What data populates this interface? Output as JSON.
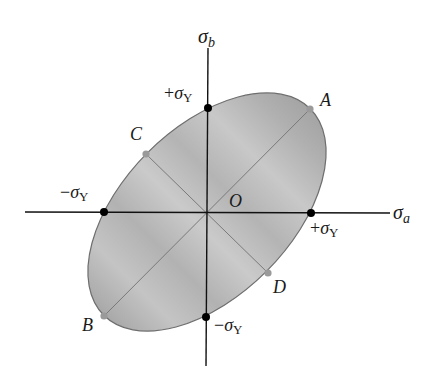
{
  "figure": {
    "type": "yield-locus-diagram",
    "axes": {
      "x_label": "σ",
      "x_sub": "a",
      "y_label": "σ",
      "y_sub": "b"
    },
    "origin_label": "O",
    "axis_intercepts": {
      "pos_x": {
        "sign": "+",
        "sym": "σ",
        "sub": "Y"
      },
      "neg_x": {
        "sign": "−",
        "sym": "σ",
        "sub": "Y"
      },
      "pos_y": {
        "sign": "+",
        "sym": "σ",
        "sub": "Y"
      },
      "neg_y": {
        "sign": "−",
        "sym": "σ",
        "sub": "Y"
      }
    },
    "points": [
      {
        "name": "A",
        "label": "A"
      },
      {
        "name": "B",
        "label": "B"
      },
      {
        "name": "C",
        "label": "C"
      },
      {
        "name": "D",
        "label": "D"
      }
    ],
    "colors": {
      "ellipse_fill_light": "#cfcfcf",
      "ellipse_fill_dark": "#a9a9a9",
      "ellipse_stroke": "#6e6e6e",
      "axis": "#111111",
      "black_dot": "#000000",
      "gray_dot": "#9a9a9a",
      "diagonal_line": "#7a7a7a"
    }
  }
}
